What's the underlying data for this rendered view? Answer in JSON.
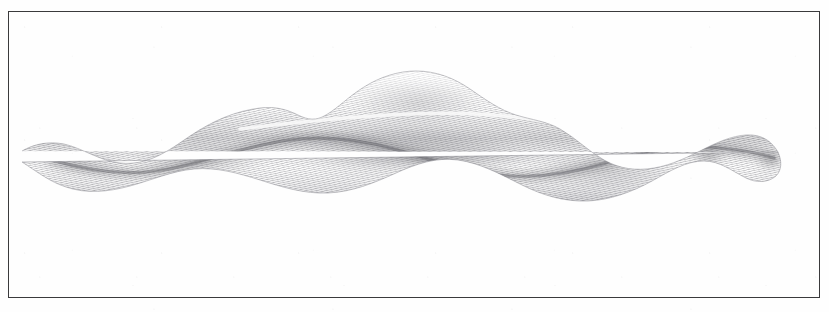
{
  "plate": {
    "medium": "engraving",
    "background_color": "#fefefe",
    "paper_tone": "#ffffff",
    "frame": {
      "name": "plate-border",
      "color": "#3a3a3c",
      "stroke_width": 1.3,
      "x": 8,
      "y": 11,
      "width": 812,
      "height": 287
    },
    "caption": ""
  },
  "specimen": {
    "name": "elongate-worm-specimen",
    "description": "elongate sinuous worm-like organism in lateral view",
    "ink_color": "#6f6f74",
    "shadow_color": "#5a5a60",
    "highlight_color": "#f4f4f5",
    "orientation": "horizontal",
    "head_end": "right",
    "tail_end": "left",
    "outline_top": "M 14 140 C 26 133, 40 130, 56 133 C 74 137, 92 150, 112 152 C 140 155, 160 140, 182 125 C 206 109, 228 100, 252 97 C 268 95, 280 99, 290 104 C 300 109, 308 110, 318 104 C 330 97, 340 86, 356 76 C 372 66, 390 60, 408 60 C 428 60, 446 67, 462 78 C 478 89, 492 99, 508 104 C 524 109, 538 110, 552 118 C 568 127, 580 140, 596 149 C 612 158, 628 160, 646 157 C 664 154, 680 146, 698 137 C 714 129, 730 123, 744 124 C 756 125, 764 131, 770 141",
    "outline_bottom": "M 770 141 C 774 150, 774 159, 768 165 C 760 172, 748 172, 738 167 C 724 160, 712 150, 696 150 C 678 150, 662 160, 644 170 C 624 181, 602 189, 580 190 C 556 191, 534 184, 514 174 C 492 163, 472 152, 450 149 C 428 146, 408 153, 388 162 C 366 172, 344 181, 320 182 C 296 183, 274 176, 252 169 C 230 162, 208 156, 186 158 C 164 160, 144 169, 122 175 C 100 181, 78 183, 58 176 C 42 171, 28 160, 14 151 Z",
    "midline_groove": "M 44 149 C 80 160, 120 166, 160 158 C 200 150, 236 136, 274 130 C 312 124, 350 128, 386 138 C 422 148, 456 160, 492 164 C 528 168, 564 162, 598 152 C 632 142, 666 134, 700 136 C 726 138, 750 142, 766 147",
    "highlight_line": "M 232 118 C 280 112, 330 107, 380 104 C 430 101, 480 102, 524 108 C 560 113, 592 122, 618 132"
  },
  "hatching": {
    "name": "engraved-hatching",
    "line_color": "#8a8a90",
    "line_spacing_px": 2.1,
    "angle_deg": 78,
    "density": "fine"
  },
  "tone_zones": [
    {
      "name": "tail-taper-left",
      "cx": 70,
      "cy": 152,
      "rx": 60,
      "ry": 18,
      "opacity": 0.22
    },
    {
      "name": "lower-flank-left",
      "cx": 190,
      "cy": 150,
      "rx": 80,
      "ry": 26,
      "opacity": 0.3
    },
    {
      "name": "dorsal-hump",
      "cx": 410,
      "cy": 92,
      "rx": 80,
      "ry": 26,
      "opacity": 0.26
    },
    {
      "name": "central-body",
      "cx": 400,
      "cy": 140,
      "rx": 140,
      "ry": 34,
      "opacity": 0.34
    },
    {
      "name": "mid-dark-band",
      "cx": 430,
      "cy": 146,
      "rx": 150,
      "ry": 11,
      "opacity": 0.42
    },
    {
      "name": "right-flank",
      "cx": 600,
      "cy": 158,
      "rx": 95,
      "ry": 26,
      "opacity": 0.32
    },
    {
      "name": "head-dark-collar",
      "cx": 700,
      "cy": 144,
      "rx": 22,
      "ry": 18,
      "opacity": 0.48
    },
    {
      "name": "head-tip",
      "cx": 762,
      "cy": 150,
      "rx": 18,
      "ry": 14,
      "opacity": 0.4
    }
  ]
}
